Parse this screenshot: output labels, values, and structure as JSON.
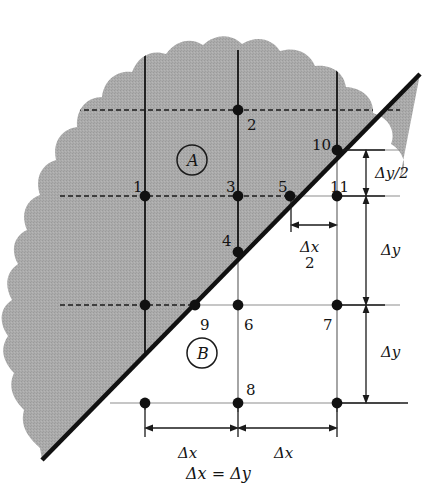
{
  "figure": {
    "colors": {
      "shaded_region": "#a8a8a8",
      "line": "#1a1a1a",
      "grid_line": "#555555",
      "background": "#ffffff",
      "boundary_line": "#111111"
    },
    "regions": [
      {
        "id": "A",
        "label": "A",
        "x": 186,
        "y": 155
      },
      {
        "id": "B",
        "label": "B",
        "x": 196,
        "y": 348
      }
    ],
    "nodes": [
      {
        "id": "1",
        "label": "1",
        "x": 145,
        "y": 196,
        "label_x": 133,
        "label_y": 180,
        "filled": true
      },
      {
        "id": "2",
        "label": "2",
        "x": 238,
        "y": 110,
        "label_x": 247,
        "label_y": 118,
        "filled": true
      },
      {
        "id": "3",
        "label": "3",
        "x": 238,
        "y": 196,
        "label_x": 226,
        "label_y": 180,
        "filled": true
      },
      {
        "id": "4",
        "label": "4",
        "x": 238,
        "y": 252,
        "label_x": 222,
        "label_y": 234,
        "filled": true
      },
      {
        "id": "5",
        "label": "5",
        "x": 290,
        "y": 196,
        "label_x": 278,
        "label_y": 180,
        "filled": true
      },
      {
        "id": "6",
        "label": "6",
        "x": 238,
        "y": 305,
        "label_x": 244,
        "label_y": 318,
        "filled": true
      },
      {
        "id": "7",
        "label": "7",
        "x": 337,
        "y": 305,
        "label_x": 323,
        "label_y": 318,
        "filled": true
      },
      {
        "id": "8",
        "label": "8",
        "x": 238,
        "y": 403,
        "label_x": 246,
        "label_y": 383,
        "filled": true
      },
      {
        "id": "9",
        "label": "9",
        "x": 195,
        "y": 305,
        "label_x": 200,
        "label_y": 318,
        "filled": true
      },
      {
        "id": "10",
        "label": "10",
        "x": 337,
        "y": 150,
        "label_x": 312,
        "label_y": 140,
        "filled": true
      },
      {
        "id": "11",
        "label": "11",
        "x": 337,
        "y": 196,
        "label_x": 330,
        "label_y": 180,
        "filled": true
      },
      {
        "id": "n-left-mid",
        "label": "",
        "x": 145,
        "y": 305,
        "label_x": 0,
        "label_y": 0,
        "filled": true
      },
      {
        "id": "n-left-bot",
        "label": "",
        "x": 145,
        "y": 403,
        "label_x": 0,
        "label_y": 0,
        "filled": true
      },
      {
        "id": "n-right-bot",
        "label": "",
        "x": 337,
        "y": 403,
        "label_x": 0,
        "label_y": 0,
        "filled": true
      }
    ],
    "dimensions": [
      {
        "id": "dy-half",
        "label": "Δy/2",
        "orientation": "vertical",
        "label_x": 375,
        "label_y": 166
      },
      {
        "id": "dy-mid",
        "label": "Δy",
        "orientation": "vertical",
        "label_x": 381,
        "label_y": 243
      },
      {
        "id": "dy-lower",
        "label": "Δy",
        "orientation": "vertical",
        "label_x": 381,
        "label_y": 345
      },
      {
        "id": "dx-left",
        "label": "Δx",
        "orientation": "horizontal",
        "label_x": 178,
        "label_y": 446
      },
      {
        "id": "dx-right",
        "label": "Δx",
        "orientation": "horizontal",
        "label_x": 274,
        "label_y": 446
      }
    ],
    "fraction_dimension": {
      "id": "dx-half",
      "numerator": "Δx",
      "denominator": "2",
      "label_x": 300,
      "label_y": 240
    },
    "caption": "Δx = Δy",
    "caption_x": 186,
    "caption_y": 466
  }
}
